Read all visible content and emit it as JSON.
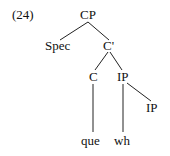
{
  "example_number": "(24)",
  "tree": {
    "root": "CP",
    "spec": "Spec",
    "cbar": "C'",
    "c": "C",
    "ip": "IP",
    "ip_lower": "IP",
    "que": "que",
    "wh": "wh"
  }
}
